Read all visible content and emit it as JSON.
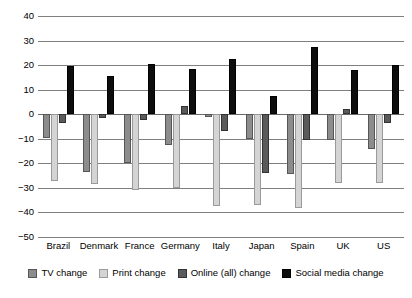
{
  "chart_data": {
    "type": "bar",
    "title": "",
    "subtitle": "",
    "xlabel": "",
    "ylabel": "",
    "ylim": [
      -50,
      40
    ],
    "yticks": [
      40,
      30,
      20,
      10,
      0,
      -10,
      -20,
      -30,
      -40,
      -50
    ],
    "ytick_labels": [
      "40",
      "30",
      "20",
      "10",
      "0",
      "−10",
      "−20",
      "−30",
      "−40",
      "−50"
    ],
    "grid": true,
    "legend_position": "bottom",
    "categories": [
      "Brazil",
      "Denmark",
      "France",
      "Germany",
      "Italy",
      "Japan",
      "Spain",
      "UK",
      "US"
    ],
    "series": [
      {
        "name": "TV change",
        "key": "tv",
        "color": "#8c8c8c",
        "values": [
          -9.5,
          -23.5,
          -20,
          -12.5,
          -1,
          -10,
          -24.5,
          -10.5,
          -14
        ]
      },
      {
        "name": "Print change",
        "key": "print",
        "color": "#d4d4d4",
        "values": [
          -27,
          -28.5,
          -31,
          -30,
          -37.5,
          -37,
          -38,
          -28,
          -28
        ]
      },
      {
        "name": "Online (all) change",
        "key": "online",
        "color": "#5a5a5a",
        "values": [
          -3.5,
          -1.5,
          -2.5,
          3.5,
          -7,
          -24,
          -10.5,
          2,
          -3.5
        ]
      },
      {
        "name": "Social media change",
        "key": "social",
        "color": "#0d0d0d",
        "values": [
          19.5,
          15.5,
          20.5,
          18.5,
          22.5,
          7.5,
          27.5,
          18,
          20
        ]
      }
    ]
  }
}
